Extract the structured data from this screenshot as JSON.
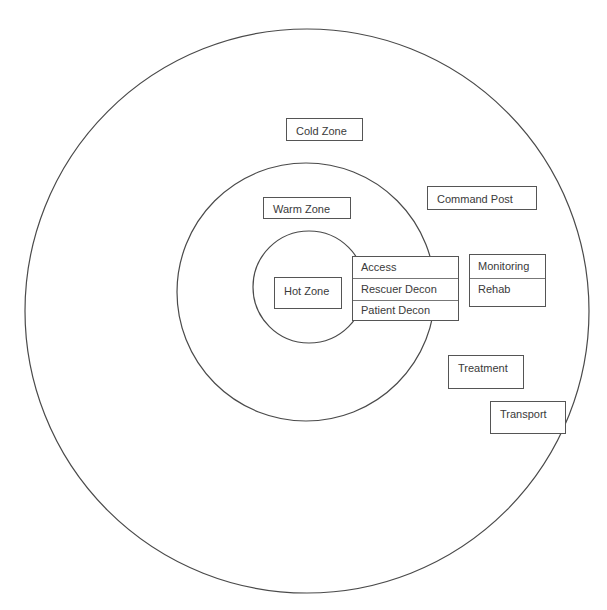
{
  "diagram": {
    "colors": {
      "stroke": "#4a4a4a",
      "box_border": "#555555",
      "text": "#3a3a3a",
      "background": "#ffffff"
    },
    "zones": [
      {
        "id": "cold",
        "label": "Cold Zone",
        "cx": 307,
        "cy": 311,
        "r": 282
      },
      {
        "id": "warm",
        "label": "Warm Zone",
        "cx": 306,
        "cy": 292,
        "r": 129
      },
      {
        "id": "hot",
        "label": "Hot Zone",
        "cx": 309,
        "cy": 287,
        "r": 56
      }
    ],
    "labels": {
      "cold_zone": "Cold Zone",
      "warm_zone": "Warm Zone",
      "hot_zone": "Hot Zone",
      "command_post": "Command Post",
      "treatment": "Treatment",
      "transport": "Transport"
    },
    "corridor": {
      "rows": [
        "Access",
        "Rescuer Decon",
        "Patient Decon"
      ]
    },
    "support": {
      "rows": [
        "Monitoring",
        "Rehab"
      ]
    }
  }
}
